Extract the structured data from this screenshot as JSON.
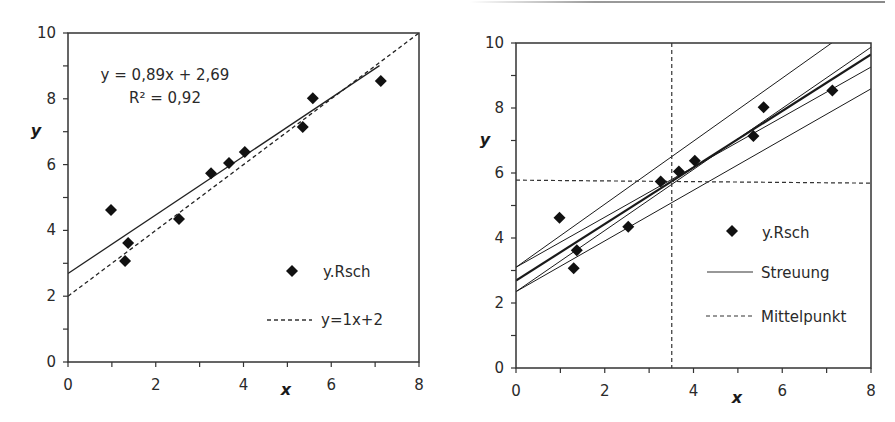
{
  "chart_data": [
    {
      "type": "scatter",
      "id": "left",
      "title": "",
      "xlabel": "x",
      "ylabel": "y",
      "xlim": [
        0,
        8
      ],
      "ylim": [
        0,
        10
      ],
      "x_ticks": [
        0,
        2,
        4,
        6,
        8
      ],
      "y_ticks": [
        0,
        2,
        4,
        6,
        8,
        10
      ],
      "minor_tick_step": 1,
      "grid": false,
      "legend_position": "lower right inside",
      "series": [
        {
          "name": "y.Rsch",
          "kind": "scatter",
          "marker": "diamond",
          "points": [
            [
              0.98,
              4.62
            ],
            [
              1.3,
              3.07
            ],
            [
              1.37,
              3.62
            ],
            [
              2.53,
              4.35
            ],
            [
              3.26,
              5.74
            ],
            [
              3.67,
              6.05
            ],
            [
              4.03,
              6.38
            ],
            [
              5.35,
              7.14
            ],
            [
              5.58,
              8.02
            ],
            [
              7.13,
              8.54
            ]
          ]
        },
        {
          "name": "trendline",
          "kind": "line",
          "style": "solid",
          "slope": 0.89,
          "intercept": 2.69,
          "x_range": [
            0,
            7.1
          ]
        },
        {
          "name": "y=1x+2",
          "kind": "line",
          "style": "dashed",
          "slope": 1,
          "intercept": 2,
          "x_range": [
            0,
            8
          ]
        }
      ],
      "annotations": [
        "y = 0,89x + 2,69",
        "R² = 0,92"
      ],
      "legend": [
        "y.Rsch",
        "y=1x+2"
      ]
    },
    {
      "type": "scatter",
      "id": "right",
      "title": "",
      "xlabel": "x",
      "ylabel": "y",
      "xlim": [
        0,
        8
      ],
      "ylim": [
        0,
        10
      ],
      "x_ticks": [
        0,
        2,
        4,
        6,
        8
      ],
      "y_ticks": [
        0,
        2,
        4,
        6,
        8,
        10
      ],
      "minor_tick_step": 1,
      "grid": false,
      "legend_position": "lower right inside",
      "series": [
        {
          "name": "y.Rsch",
          "kind": "scatter",
          "marker": "diamond",
          "points": [
            [
              0.98,
              4.62
            ],
            [
              1.3,
              3.07
            ],
            [
              1.37,
              3.62
            ],
            [
              2.53,
              4.35
            ],
            [
              3.26,
              5.74
            ],
            [
              3.67,
              6.05
            ],
            [
              4.03,
              6.38
            ],
            [
              5.35,
              7.14
            ],
            [
              5.58,
              8.02
            ],
            [
              7.13,
              8.54
            ]
          ]
        },
        {
          "name": "Streuung",
          "kind": "lines",
          "style": "solid",
          "lines": [
            {
              "slope": 0.97,
              "intercept": 3.1,
              "width": 1
            },
            {
              "slope": 0.94,
              "intercept": 2.35,
              "width": 1
            },
            {
              "slope": 0.87,
              "intercept": 2.69,
              "width": 2.2
            },
            {
              "slope": 0.77,
              "intercept": 3.1,
              "width": 1
            },
            {
              "slope": 0.78,
              "intercept": 2.35,
              "width": 1
            }
          ]
        },
        {
          "name": "Mittelpunkt",
          "kind": "crosshair",
          "style": "dashed",
          "x": 3.51,
          "y": 5.78
        }
      ],
      "legend": [
        "y.Rsch",
        "Streuung",
        "Mittelpunkt"
      ]
    }
  ],
  "charts": {
    "left": {
      "annotation_line1": "y = 0,89x + 2,69",
      "annotation_line2": "R² = 0,92",
      "legend": {
        "item1": "y.Rsch",
        "item2": "y=1x+2"
      },
      "xlabel": "x",
      "ylabel": "y"
    },
    "right": {
      "legend": {
        "item1": "y.Rsch",
        "item2": "Streuung",
        "item3": "Mittelpunkt"
      },
      "xlabel": "x",
      "ylabel": "y"
    }
  }
}
